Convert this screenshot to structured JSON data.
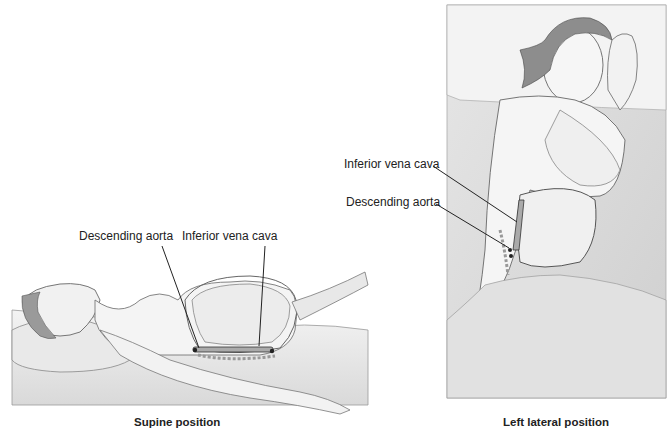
{
  "figure": {
    "panels": [
      {
        "id": "supine",
        "caption": "Supine position",
        "labels": {
          "aorta": "Descending aorta",
          "vena_cava": "Inferior vena cava"
        }
      },
      {
        "id": "left-lateral",
        "caption": "Left lateral position",
        "labels": {
          "vena_cava": "Inferior vena cava",
          "aorta": "Descending aorta"
        }
      }
    ]
  }
}
